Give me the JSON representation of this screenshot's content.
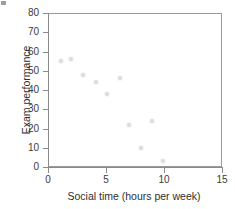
{
  "figure": {
    "background": "#ffffff",
    "frame_color": "#9a9a9a",
    "marker_color": "#dcdcdc",
    "text_color": "#2e2e2e"
  },
  "chart_data": {
    "type": "scatter",
    "title": "",
    "xlabel": "Social time (hours per week)",
    "ylabel": "Exam performance",
    "xlim": [
      0,
      15
    ],
    "ylim": [
      0,
      80
    ],
    "xticks": [
      0,
      5,
      10,
      15
    ],
    "yticks": [
      0,
      10,
      20,
      30,
      40,
      50,
      60,
      70,
      80
    ],
    "xtick_labels": [
      "0",
      "5",
      "10",
      "15"
    ],
    "ytick_labels": [
      "0",
      "10",
      "20",
      "30",
      "40",
      "50",
      "60",
      "70",
      "80"
    ],
    "grid": false,
    "legend": null,
    "x": [
      1.1,
      2.0,
      3.0,
      4.1,
      5.1,
      6.2,
      7.0,
      8.0,
      9.0,
      9.9
    ],
    "y": [
      55,
      56,
      48,
      44,
      38,
      46,
      22,
      10,
      24,
      3
    ],
    "points": [
      {
        "x": 1.1,
        "y": 55
      },
      {
        "x": 2.0,
        "y": 56
      },
      {
        "x": 3.0,
        "y": 48
      },
      {
        "x": 4.1,
        "y": 44
      },
      {
        "x": 5.1,
        "y": 38
      },
      {
        "x": 6.2,
        "y": 46
      },
      {
        "x": 7.0,
        "y": 22
      },
      {
        "x": 8.0,
        "y": 10
      },
      {
        "x": 9.0,
        "y": 24
      },
      {
        "x": 9.9,
        "y": 3
      }
    ]
  }
}
